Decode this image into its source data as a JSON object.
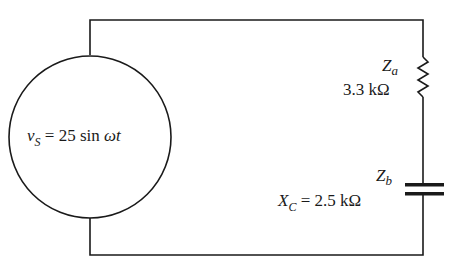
{
  "diagram": {
    "type": "circuit",
    "colors": {
      "wire": "#1a1a1a",
      "background": "#ffffff"
    },
    "source": {
      "var": "v",
      "sub": "S",
      "expr": "= 25 sin ",
      "omega_t": "ωt",
      "full": "vS = 25 sin ωt"
    },
    "za": {
      "name": "Z",
      "sub": "a",
      "value": "3.3 kΩ",
      "component": "resistor"
    },
    "zb": {
      "name": "Z",
      "sub": "b",
      "x_name": "X",
      "x_sub": "C",
      "value": "= 2.5 kΩ",
      "component": "capacitor"
    }
  }
}
